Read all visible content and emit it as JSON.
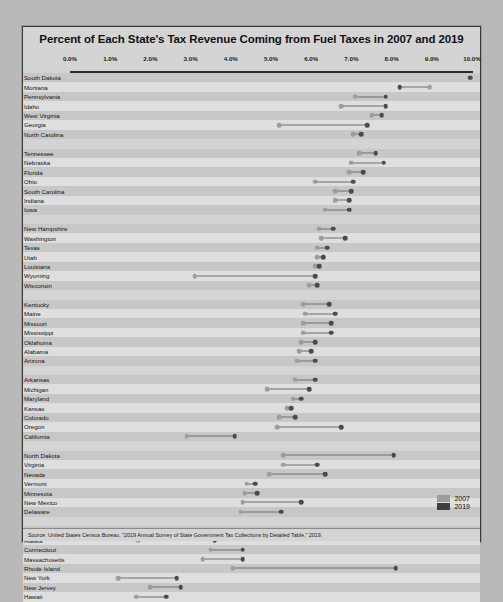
{
  "chart_data": {
    "type": "scatter",
    "subtype": "dumbbell",
    "title": "Percent of Each State's Tax Revenue Coming from Fuel Taxes in 2007 and 2019",
    "xlabel": "",
    "ylabel": "",
    "xlim": [
      0,
      10
    ],
    "xticks": [
      0,
      1,
      2,
      3,
      4,
      5,
      6,
      7,
      8,
      9,
      10
    ],
    "xticklabels": [
      "0.0%",
      "1.0%",
      "2.0%",
      "3.0%",
      "4.0%",
      "5.0%",
      "6.0%",
      "7.0%",
      "8.0%",
      "9.0%",
      "10.0%"
    ],
    "grid": false,
    "legend": {
      "position": "bottom-right",
      "entries": [
        {
          "name": "2007",
          "color": "#9d9d9d"
        },
        {
          "name": "2019",
          "color": "#3f3f3f"
        }
      ]
    },
    "series": [
      {
        "name": "2007",
        "color": "#9d9d9d"
      },
      {
        "name": "2019",
        "color": "#4a4a4a"
      }
    ],
    "groups": [
      {
        "rows": [
          {
            "label": "South Dakota",
            "v2007": 9.95,
            "v2019": 9.95
          },
          {
            "label": "Montana",
            "v2007": 8.95,
            "v2019": 8.2
          },
          {
            "label": "Pennsylvania",
            "v2007": 7.1,
            "v2019": 7.85
          },
          {
            "label": "Idaho",
            "v2007": 6.75,
            "v2019": 7.85
          },
          {
            "label": "West Virginia",
            "v2007": 7.5,
            "v2019": 7.75
          },
          {
            "label": "Georgia",
            "v2007": 5.2,
            "v2019": 7.4
          },
          {
            "label": "North Carolina",
            "v2007": 7.05,
            "v2019": 7.25
          }
        ]
      },
      {
        "rows": [
          {
            "label": "Tennessee",
            "v2007": 7.2,
            "v2019": 7.6
          },
          {
            "label": "Nebraska",
            "v2007": 7.0,
            "v2019": 7.8
          },
          {
            "label": "Florida",
            "v2007": 6.95,
            "v2019": 7.3
          },
          {
            "label": "Ohio",
            "v2007": 6.1,
            "v2019": 7.05
          },
          {
            "label": "South Carolina",
            "v2007": 6.6,
            "v2019": 7.0
          },
          {
            "label": "Indiana",
            "v2007": 6.6,
            "v2019": 6.95
          },
          {
            "label": "Iowa",
            "v2007": 6.35,
            "v2019": 6.95
          }
        ]
      },
      {
        "rows": [
          {
            "label": "New Hampshire",
            "v2007": 6.2,
            "v2019": 6.55
          },
          {
            "label": "Washington",
            "v2007": 6.25,
            "v2019": 6.85
          },
          {
            "label": "Texas",
            "v2007": 6.15,
            "v2019": 6.4
          },
          {
            "label": "Utah",
            "v2007": 6.15,
            "v2019": 6.3
          },
          {
            "label": "Louisiana",
            "v2007": 6.1,
            "v2019": 6.2
          },
          {
            "label": "Wyoming",
            "v2007": 3.1,
            "v2019": 6.1
          },
          {
            "label": "Wisconsin",
            "v2007": 5.95,
            "v2019": 6.15
          }
        ]
      },
      {
        "rows": [
          {
            "label": "Kentucky",
            "v2007": 5.8,
            "v2019": 6.45
          },
          {
            "label": "Maine",
            "v2007": 5.85,
            "v2019": 6.6
          },
          {
            "label": "Missouri",
            "v2007": 5.8,
            "v2019": 6.5
          },
          {
            "label": "Mississippi",
            "v2007": 5.8,
            "v2019": 6.5
          },
          {
            "label": "Oklahoma",
            "v2007": 5.75,
            "v2019": 6.1
          },
          {
            "label": "Alabama",
            "v2007": 5.7,
            "v2019": 6.0
          },
          {
            "label": "Arizona",
            "v2007": 5.65,
            "v2019": 6.1
          }
        ]
      },
      {
        "rows": [
          {
            "label": "Arkansas",
            "v2007": 5.6,
            "v2019": 6.1
          },
          {
            "label": "Michigan",
            "v2007": 4.9,
            "v2019": 5.95
          },
          {
            "label": "Maryland",
            "v2007": 5.55,
            "v2019": 5.75
          },
          {
            "label": "Kansas",
            "v2007": 5.4,
            "v2019": 5.5
          },
          {
            "label": "Colorado",
            "v2007": 5.2,
            "v2019": 5.6
          },
          {
            "label": "Oregon",
            "v2007": 5.15,
            "v2019": 6.75
          },
          {
            "label": "California",
            "v2007": 2.9,
            "v2019": 4.1
          }
        ]
      },
      {
        "rows": [
          {
            "label": "North Dakota",
            "v2007": 5.3,
            "v2019": 8.05
          },
          {
            "label": "Virginia",
            "v2007": 5.3,
            "v2019": 6.15
          },
          {
            "label": "Nevada",
            "v2007": 4.95,
            "v2019": 6.35
          },
          {
            "label": "Vermont",
            "v2007": 4.4,
            "v2019": 4.6
          },
          {
            "label": "Minnesota",
            "v2007": 4.35,
            "v2019": 4.65
          },
          {
            "label": "New Mexico",
            "v2007": 4.3,
            "v2019": 5.75
          },
          {
            "label": "Delaware",
            "v2007": 4.25,
            "v2019": 5.25
          }
        ]
      },
      {
        "rows": [
          {
            "label": "Illinois",
            "v2007": 4.2,
            "v2019": 6.2
          },
          {
            "label": "Alaska",
            "v2007": 1.7,
            "v2019": 3.6
          },
          {
            "label": "Connecticut",
            "v2007": 3.5,
            "v2019": 4.3
          },
          {
            "label": "Massachusetts",
            "v2007": 3.3,
            "v2019": 4.3
          },
          {
            "label": "Rhode Island",
            "v2007": 4.05,
            "v2019": 8.1
          },
          {
            "label": "New York",
            "v2007": 1.2,
            "v2019": 2.65
          },
          {
            "label": "New Jersey",
            "v2007": 2.0,
            "v2019": 2.75
          },
          {
            "label": "Hawaii",
            "v2007": 1.65,
            "v2019": 2.4
          }
        ]
      }
    ],
    "source": "Source: United States Census Bureau, \"2019 Annual Survey of State Government Tax Collections by Detailed Table,\" 2019."
  }
}
